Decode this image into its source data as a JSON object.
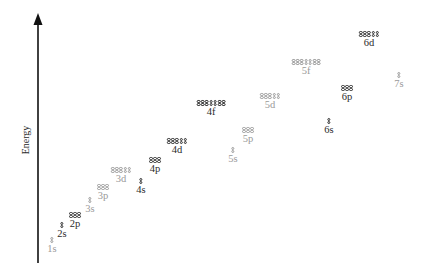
{
  "diagram": {
    "axis": {
      "label": "Energy",
      "direction": "up",
      "color": "#111111"
    },
    "colors": {
      "highlight": "#2b2b2b",
      "muted": "#9a9a9a"
    },
    "subshells": [
      {
        "id": "1s",
        "label": "1s",
        "orbitals": 1,
        "style": "gray",
        "x": 52,
        "y": 237
      },
      {
        "id": "2s",
        "label": "2s",
        "orbitals": 1,
        "style": "dark",
        "x": 62,
        "y": 222
      },
      {
        "id": "2p",
        "label": "2p",
        "orbitals": 3,
        "style": "dark",
        "x": 75,
        "y": 212
      },
      {
        "id": "3s",
        "label": "3s",
        "orbitals": 1,
        "style": "gray",
        "x": 90,
        "y": 197
      },
      {
        "id": "3p",
        "label": "3p",
        "orbitals": 3,
        "style": "gray",
        "x": 103,
        "y": 184
      },
      {
        "id": "3d",
        "label": "3d",
        "orbitals": 5,
        "style": "gray",
        "x": 121,
        "y": 167
      },
      {
        "id": "4s",
        "label": "4s",
        "orbitals": 1,
        "style": "dark",
        "x": 141,
        "y": 178
      },
      {
        "id": "4p",
        "label": "4p",
        "orbitals": 3,
        "style": "dark",
        "x": 155,
        "y": 157
      },
      {
        "id": "4d",
        "label": "4d",
        "orbitals": 5,
        "style": "dark",
        "x": 177,
        "y": 138
      },
      {
        "id": "4f",
        "label": "4f",
        "orbitals": 7,
        "style": "dark",
        "x": 211,
        "y": 100
      },
      {
        "id": "5s",
        "label": "5s",
        "orbitals": 1,
        "style": "gray",
        "x": 233,
        "y": 147
      },
      {
        "id": "5p",
        "label": "5p",
        "orbitals": 3,
        "style": "gray",
        "x": 248,
        "y": 127
      },
      {
        "id": "5d",
        "label": "5d",
        "orbitals": 5,
        "style": "gray",
        "x": 270,
        "y": 93
      },
      {
        "id": "5f",
        "label": "5f",
        "orbitals": 7,
        "style": "gray",
        "x": 306,
        "y": 59
      },
      {
        "id": "6s",
        "label": "6s",
        "orbitals": 1,
        "style": "dark",
        "x": 329,
        "y": 118
      },
      {
        "id": "6p",
        "label": "6p",
        "orbitals": 3,
        "style": "dark",
        "x": 347,
        "y": 85
      },
      {
        "id": "6d",
        "label": "6d",
        "orbitals": 5,
        "style": "dark",
        "x": 369,
        "y": 31
      },
      {
        "id": "7s",
        "label": "7s",
        "orbitals": 1,
        "style": "gray",
        "x": 399,
        "y": 72
      }
    ]
  }
}
